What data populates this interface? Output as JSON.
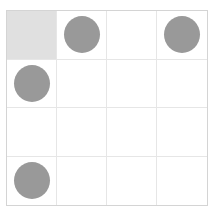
{
  "board": {
    "rows": 4,
    "cols": 4,
    "highlight_color": "#e0e0e0",
    "piece_color": "#999999",
    "grid_line_color": "#e6e6e6",
    "border_color": "#d4d4d4",
    "cells": [
      [
        {
          "highlight": true,
          "piece": false
        },
        {
          "highlight": false,
          "piece": true
        },
        {
          "highlight": false,
          "piece": false
        },
        {
          "highlight": false,
          "piece": true
        }
      ],
      [
        {
          "highlight": false,
          "piece": true
        },
        {
          "highlight": false,
          "piece": false
        },
        {
          "highlight": false,
          "piece": false
        },
        {
          "highlight": false,
          "piece": false
        }
      ],
      [
        {
          "highlight": false,
          "piece": false
        },
        {
          "highlight": false,
          "piece": false
        },
        {
          "highlight": false,
          "piece": false
        },
        {
          "highlight": false,
          "piece": false
        }
      ],
      [
        {
          "highlight": false,
          "piece": true
        },
        {
          "highlight": false,
          "piece": false
        },
        {
          "highlight": false,
          "piece": false
        },
        {
          "highlight": false,
          "piece": false
        }
      ]
    ]
  }
}
